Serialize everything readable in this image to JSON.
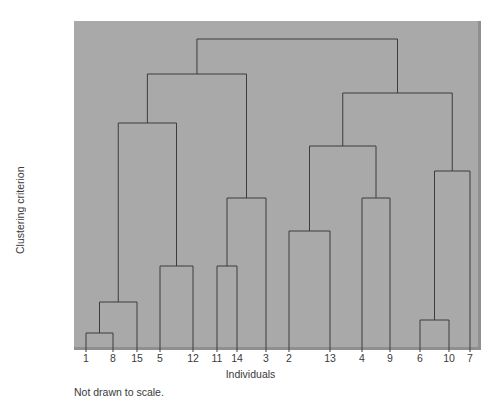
{
  "chart_data": {
    "type": "line",
    "title": "",
    "xlabel": "Individuals",
    "ylabel": "Clustering criterion",
    "footnote": "Not drawn to scale.",
    "note": "Hierarchical clustering dendrogram; vertical axis is not linear (not drawn to scale).",
    "grid": false,
    "legend": "none",
    "background_color": "#a9a9a9",
    "line_color": "#3c3c3c",
    "text_color": "#3a3a3a",
    "leaf_order": [
      "1",
      "8",
      "15",
      "5",
      "12",
      "11",
      "14",
      "3",
      "2",
      "13",
      "4",
      "9",
      "6",
      "10",
      "7"
    ],
    "y_tick_labels": [
      ".463",
      ".296",
      ".104",
      ".042",
      ".037",
      ".017",
      ".008",
      ".006",
      ".004",
      ".0027",
      ".0024",
      ".0016"
    ],
    "y_tick_values": [
      0.463,
      0.296,
      0.104,
      0.042,
      0.037,
      0.017,
      0.008,
      0.006,
      0.004,
      0.0027,
      0.0024,
      0.0016
    ],
    "y_tick_pixels": [
      44,
      78,
      98,
      130,
      155,
      184,
      204,
      240,
      270,
      303,
      325,
      340
    ],
    "leaf_pixels": [
      86,
      113,
      137,
      160,
      193,
      217,
      237,
      266,
      289,
      330,
      362,
      390,
      420,
      449,
      470
    ],
    "merges": [
      {
        "id": "m1",
        "label": ".0016",
        "height": 0.0016,
        "y_px": 333,
        "left": "1",
        "right": "8"
      },
      {
        "id": "m2",
        "label": ".0024",
        "height": 0.0024,
        "y_px": 320,
        "left": "6",
        "right": "10"
      },
      {
        "id": "m3",
        "label": ".0027",
        "height": 0.0027,
        "y_px": 302,
        "left": "m1",
        "right": "15"
      },
      {
        "id": "m4",
        "label": ".004",
        "height": 0.004,
        "y_px": 266,
        "left": "5",
        "right": "12"
      },
      {
        "id": "m5",
        "label": ".004",
        "height": 0.004,
        "y_px": 266,
        "left": "11",
        "right": "14"
      },
      {
        "id": "m6",
        "label": ".006",
        "height": 0.006,
        "y_px": 231,
        "left": "2",
        "right": "13"
      },
      {
        "id": "m7",
        "label": ".008",
        "height": 0.008,
        "y_px": 198,
        "left": "m5",
        "right": "3"
      },
      {
        "id": "m8",
        "label": ".008",
        "height": 0.008,
        "y_px": 198,
        "left": "4",
        "right": "9"
      },
      {
        "id": "m9",
        "label": ".017",
        "height": 0.017,
        "y_px": 171,
        "left": "m2",
        "right": "7"
      },
      {
        "id": "m10",
        "label": ".037",
        "height": 0.037,
        "y_px": 146,
        "left": "m6",
        "right": "m8"
      },
      {
        "id": "m11",
        "label": ".042",
        "height": 0.042,
        "y_px": 123,
        "left": "m3",
        "right": "m4"
      },
      {
        "id": "m12",
        "label": ".104",
        "height": 0.104,
        "y_px": 93,
        "left": "m10",
        "right": "m9"
      },
      {
        "id": "m13",
        "label": ".296",
        "height": 0.296,
        "y_px": 74,
        "left": "m11",
        "right": "m7"
      },
      {
        "id": "m14",
        "label": ".463",
        "height": 0.463,
        "y_px": 39,
        "left": "m13",
        "right": "m12"
      }
    ]
  },
  "axis": {
    "y_title": "Clustering criterion",
    "x_title": "Individuals",
    "footnote": "Not drawn to scale."
  }
}
